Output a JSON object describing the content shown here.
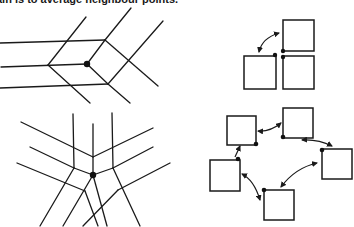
{
  "caption": "ain is to average neighbour points.",
  "panels": {
    "top_left": {
      "label": "quad mesh vertex with regular valence",
      "node_dot": [
        87,
        64
      ]
    },
    "bottom_left": {
      "label": "mesh vertex with irregular valence (5 edges)",
      "node_dot": [
        93,
        175
      ]
    },
    "top_right": {
      "label": "three adjacent patches around a corner",
      "boxes": 3,
      "arrows": 1
    },
    "bottom_right": {
      "label": "five patches around an extraordinary point",
      "boxes": 5,
      "arrows": 5
    }
  },
  "colors": {
    "ink": "#1a1a1a",
    "background": "#ffffff"
  }
}
